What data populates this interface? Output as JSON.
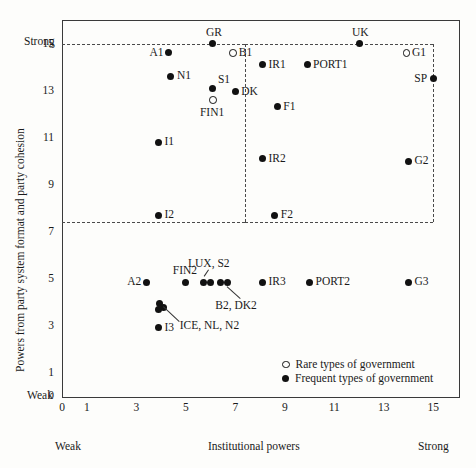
{
  "chart_data": {
    "type": "scatter",
    "title": "",
    "xlabel": "Institutional powers",
    "ylabel": "Powers from party system format and party cohesion",
    "xlim": [
      0,
      16
    ],
    "ylim": [
      0,
      16
    ],
    "x_ticks": [
      0,
      1,
      3,
      5,
      7,
      9,
      11,
      13,
      15
    ],
    "y_ticks": [
      0,
      1,
      3,
      5,
      7,
      9,
      11,
      13,
      15
    ],
    "x_axis_low_label": "Weak",
    "x_axis_high_label": "Strong",
    "y_axis_low_label": "Weak",
    "y_axis_high_label": "Strong",
    "grid": false,
    "guides": {
      "horizontal": [
        15,
        7.4
      ],
      "vertical": [
        7.4,
        15
      ],
      "style": "dashed"
    },
    "legend": {
      "position": "bottom-right-inside",
      "entries": [
        {
          "marker": "open",
          "label": "Rare types of government"
        },
        {
          "marker": "filled",
          "label": "Frequent types of government"
        }
      ]
    },
    "series": [
      {
        "name": "Rare types of government",
        "marker": "open",
        "points": [
          {
            "label": "B1",
            "x": 6.9,
            "y": 14.6,
            "label_pos": "right"
          },
          {
            "label": "FIN1",
            "x": 6.1,
            "y": 12.6,
            "label_pos": "below"
          },
          {
            "label": "G1",
            "x": 13.9,
            "y": 14.6,
            "label_pos": "right"
          }
        ]
      },
      {
        "name": "Frequent types of government",
        "marker": "filled",
        "points": [
          {
            "label": "GR",
            "x": 6.1,
            "y": 15.0,
            "label_pos": "above"
          },
          {
            "label": "A1",
            "x": 4.3,
            "y": 14.6,
            "label_pos": "left"
          },
          {
            "label": "N1",
            "x": 4.4,
            "y": 13.6,
            "label_pos": "right"
          },
          {
            "label": "S1",
            "x": 6.1,
            "y": 13.1,
            "label_pos": "upper-right"
          },
          {
            "label": "DK",
            "x": 7.0,
            "y": 12.95,
            "label_pos": "right"
          },
          {
            "label": "I1",
            "x": 3.9,
            "y": 10.8,
            "label_pos": "right"
          },
          {
            "label": "I2",
            "x": 3.9,
            "y": 7.7,
            "label_pos": "right"
          },
          {
            "label": "UK",
            "x": 12.0,
            "y": 15.0,
            "label_pos": "above"
          },
          {
            "label": "IR1",
            "x": 8.1,
            "y": 14.1,
            "label_pos": "right"
          },
          {
            "label": "PORT1",
            "x": 9.9,
            "y": 14.1,
            "label_pos": "right"
          },
          {
            "label": "SP",
            "x": 15.0,
            "y": 13.5,
            "label_pos": "left"
          },
          {
            "label": "F1",
            "x": 8.7,
            "y": 12.3,
            "label_pos": "right"
          },
          {
            "label": "IR2",
            "x": 8.1,
            "y": 10.1,
            "label_pos": "right"
          },
          {
            "label": "G2",
            "x": 14.0,
            "y": 10.0,
            "label_pos": "right"
          },
          {
            "label": "F2",
            "x": 8.6,
            "y": 7.7,
            "label_pos": "right"
          },
          {
            "label": "A2",
            "x": 3.4,
            "y": 4.85,
            "label_pos": "left"
          },
          {
            "label": "FIN2",
            "x": 5.0,
            "y": 4.85,
            "label_pos": "above"
          },
          {
            "label": "LUX",
            "x": 5.7,
            "y": 4.85,
            "label_pos": "none"
          },
          {
            "label": "S2",
            "x": 6.0,
            "y": 4.85,
            "label_pos": "none"
          },
          {
            "label": "B2",
            "x": 6.4,
            "y": 4.85,
            "label_pos": "none"
          },
          {
            "label": "DK2",
            "x": 6.7,
            "y": 4.85,
            "label_pos": "none"
          },
          {
            "label": "ICE",
            "x": 3.95,
            "y": 3.95,
            "label_pos": "none"
          },
          {
            "label": "NL",
            "x": 4.1,
            "y": 3.75,
            "label_pos": "none"
          },
          {
            "label": "N2",
            "x": 3.9,
            "y": 3.7,
            "label_pos": "none"
          },
          {
            "label": "I3",
            "x": 3.9,
            "y": 2.9,
            "label_pos": "right"
          },
          {
            "label": "IR3",
            "x": 8.1,
            "y": 4.85,
            "label_pos": "right"
          },
          {
            "label": "PORT2",
            "x": 10.0,
            "y": 4.85,
            "label_pos": "right"
          },
          {
            "label": "G3",
            "x": 14.0,
            "y": 4.85,
            "label_pos": "right"
          }
        ]
      }
    ],
    "callouts": [
      {
        "text": "LUX, S2",
        "points": [
          "LUX",
          "S2"
        ]
      },
      {
        "text": "B2, DK2",
        "points": [
          "B2",
          "DK2"
        ]
      },
      {
        "text": "ICE, NL, N2",
        "points": [
          "ICE",
          "NL",
          "N2"
        ]
      }
    ]
  },
  "labels": {
    "y_axis_title": "Powers from party system format and party cohesion",
    "x_axis_title": "Institutional powers",
    "y_strong": "Strong",
    "y_weak": "Weak",
    "x_weak": "Weak",
    "x_strong": "Strong",
    "y_ticks": [
      "15",
      "13",
      "11",
      "9",
      "7",
      "5",
      "3",
      "1",
      "0"
    ],
    "x_ticks": [
      "0",
      "1",
      "3",
      "5",
      "7",
      "9",
      "11",
      "13",
      "15"
    ],
    "callout_lux_s2": "LUX, S2",
    "callout_b2_dk2": "B2, DK2",
    "callout_ice_nl_n2": "ICE, NL, N2",
    "legend_rare": "Rare types of government",
    "legend_frequent": "Frequent types of government"
  }
}
